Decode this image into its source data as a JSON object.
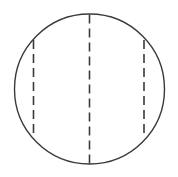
{
  "figure": {
    "canvas": {
      "width": 178,
      "height": 177,
      "background": "#ffffff"
    },
    "stroke": {
      "color": "#3a3a3a",
      "outline_width": 1.4,
      "dash_width": 1.6,
      "dash_pattern": "9 5"
    },
    "circle": {
      "name": "outline-circle",
      "cx": 89.5,
      "cy": 89,
      "r": 75,
      "fill": "none"
    },
    "chords": [
      {
        "name": "left-chord",
        "x": 33.5,
        "y_top": 40,
        "y_bottom": 138,
        "style": "dashed"
      },
      {
        "name": "center-diameter",
        "x": 89.5,
        "y_top": 14.5,
        "y_bottom": 163.5,
        "style": "dashed"
      },
      {
        "name": "right-chord",
        "x": 144,
        "y_top": 40,
        "y_bottom": 138,
        "style": "dashed"
      }
    ]
  }
}
